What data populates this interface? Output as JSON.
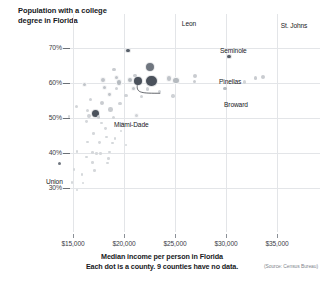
{
  "chart_data": {
    "type": "scatter",
    "title": "Population with a college degree in Florida",
    "xlabel": "Median income per person in Florida",
    "sublabel": "Each dot is a county. 9 counties have no data.",
    "source": "(Source: Census Bureau)",
    "xlim": [
      12500,
      36500
    ],
    "ylim": [
      26,
      73
    ],
    "xticks": [
      15000,
      20000,
      25000,
      30000,
      35000
    ],
    "xtick_labels": [
      "$15,000",
      "$20,000",
      "$25,000",
      "$30,000",
      "$35,000"
    ],
    "yticks": [
      30,
      40,
      50,
      60,
      70
    ],
    "ytick_labels": [
      "30%",
      "40%",
      "50%",
      "60%",
      "70%"
    ],
    "grid": true,
    "legend": "none",
    "size_encoding": "county population",
    "points": [
      {
        "label": "Leon",
        "x": 20400,
        "y": 69.3,
        "r": 2.6,
        "shade": "#58606a"
      },
      {
        "label": "St. Johns",
        "x": 30300,
        "y": 67.6,
        "r": 2.6,
        "shade": "#58606a"
      },
      {
        "label": "Seminole",
        "x": 22500,
        "y": 64.5,
        "r": 5.0,
        "shade": "#6f767f"
      },
      {
        "label": "Pinellas",
        "x": 22700,
        "y": 60.6,
        "r": 6.4,
        "shade": "#4b525c"
      },
      {
        "label": "Broward",
        "x": 21400,
        "y": 60.5,
        "r": 4.8,
        "shade": "#4b525c"
      },
      {
        "label": "Miami-Dade",
        "x": 17200,
        "y": 51.3,
        "r": 4.5,
        "shade": "#4b525c"
      },
      {
        "label": "Union",
        "x": 13700,
        "y": 37.0,
        "r": 1.5,
        "shade": "#6f767f"
      },
      {
        "label": "",
        "x": 19000,
        "y": 63.9,
        "r": 1.8,
        "shade": "#c9ccd0"
      },
      {
        "label": "",
        "x": 21100,
        "y": 62.1,
        "r": 1.8,
        "shade": "#c9ccd0"
      },
      {
        "label": "",
        "x": 24400,
        "y": 61.3,
        "r": 3.2,
        "shade": "#c0c4c9"
      },
      {
        "label": "",
        "x": 25100,
        "y": 60.7,
        "r": 3.6,
        "shade": "#b5babf"
      },
      {
        "label": "",
        "x": 27000,
        "y": 62.0,
        "r": 2.0,
        "shade": "#c9ccd0"
      },
      {
        "label": "",
        "x": 26900,
        "y": 60.4,
        "r": 1.7,
        "shade": "#c9ccd0"
      },
      {
        "label": "",
        "x": 29900,
        "y": 58.4,
        "r": 1.9,
        "shade": "#b5babf"
      },
      {
        "label": "",
        "x": 32900,
        "y": 61.5,
        "r": 1.9,
        "shade": "#c9ccd0"
      },
      {
        "label": "",
        "x": 33600,
        "y": 61.8,
        "r": 2.2,
        "shade": "#c9ccd0"
      },
      {
        "label": "",
        "x": 31800,
        "y": 60.3,
        "r": 1.6,
        "shade": "#d2d5d8"
      },
      {
        "label": "",
        "x": 17900,
        "y": 61.0,
        "r": 3.0,
        "shade": "#c0c4c9"
      },
      {
        "label": "",
        "x": 19300,
        "y": 61.6,
        "r": 2.6,
        "shade": "#c0c4c9"
      },
      {
        "label": "",
        "x": 19500,
        "y": 60.2,
        "r": 3.3,
        "shade": "#b5babf"
      },
      {
        "label": "",
        "x": 20600,
        "y": 60.9,
        "r": 3.3,
        "shade": "#b5babf"
      },
      {
        "label": "",
        "x": 16100,
        "y": 59.6,
        "r": 2.6,
        "shade": "#c0c4c9"
      },
      {
        "label": "",
        "x": 18100,
        "y": 58.7,
        "r": 2.5,
        "shade": "#c0c4c9"
      },
      {
        "label": "",
        "x": 19300,
        "y": 58.5,
        "r": 1.6,
        "shade": "#cfd2d6"
      },
      {
        "label": "",
        "x": 20900,
        "y": 58.4,
        "r": 2.6,
        "shade": "#c0c4c9"
      },
      {
        "label": "",
        "x": 22300,
        "y": 58.3,
        "r": 1.7,
        "shade": "#cfd2d6"
      },
      {
        "label": "",
        "x": 23500,
        "y": 57.6,
        "r": 1.6,
        "shade": "#cfd2d6"
      },
      {
        "label": "",
        "x": 18600,
        "y": 56.8,
        "r": 2.4,
        "shade": "#c0c4c9"
      },
      {
        "label": "",
        "x": 20200,
        "y": 56.5,
        "r": 1.7,
        "shade": "#cfd2d6"
      },
      {
        "label": "",
        "x": 21700,
        "y": 56.1,
        "r": 1.7,
        "shade": "#cfd2d6"
      },
      {
        "label": "",
        "x": 24800,
        "y": 56.3,
        "r": 1.7,
        "shade": "#cfd2d6"
      },
      {
        "label": "",
        "x": 16700,
        "y": 55.3,
        "r": 1.7,
        "shade": "#cfd2d6"
      },
      {
        "label": "",
        "x": 17800,
        "y": 54.4,
        "r": 2.0,
        "shade": "#c9ccd0"
      },
      {
        "label": "",
        "x": 19600,
        "y": 54.1,
        "r": 1.6,
        "shade": "#cfd2d6"
      },
      {
        "label": "",
        "x": 15300,
        "y": 53.3,
        "r": 1.5,
        "shade": "#d2d5d8"
      },
      {
        "label": "",
        "x": 16400,
        "y": 52.2,
        "r": 1.5,
        "shade": "#d2d5d8"
      },
      {
        "label": "",
        "x": 18700,
        "y": 52.4,
        "r": 2.3,
        "shade": "#c9ccd0"
      },
      {
        "label": "",
        "x": 14600,
        "y": 50.4,
        "r": 1.4,
        "shade": "#d2d5d8"
      },
      {
        "label": "",
        "x": 16600,
        "y": 50.5,
        "r": 1.9,
        "shade": "#cfd2d6"
      },
      {
        "label": "",
        "x": 17500,
        "y": 50.3,
        "r": 1.8,
        "shade": "#cfd2d6"
      },
      {
        "label": "",
        "x": 19000,
        "y": 50.1,
        "r": 1.5,
        "shade": "#d2d5d8"
      },
      {
        "label": "",
        "x": 16300,
        "y": 49.1,
        "r": 1.4,
        "shade": "#d5d8db"
      },
      {
        "label": "",
        "x": 17800,
        "y": 48.6,
        "r": 1.4,
        "shade": "#d5d8db"
      },
      {
        "label": "",
        "x": 19900,
        "y": 48.5,
        "r": 1.5,
        "shade": "#d5d8db"
      },
      {
        "label": "",
        "x": 21200,
        "y": 50.8,
        "r": 2.6,
        "shade": "#cfd2d6"
      },
      {
        "label": "",
        "x": 18200,
        "y": 46.9,
        "r": 1.4,
        "shade": "#d5d8db"
      },
      {
        "label": "",
        "x": 19700,
        "y": 46.3,
        "r": 1.3,
        "shade": "#d5d8db"
      },
      {
        "label": "",
        "x": 17000,
        "y": 45.5,
        "r": 1.3,
        "shade": "#d5d8db"
      },
      {
        "label": "",
        "x": 18300,
        "y": 44.6,
        "r": 1.4,
        "shade": "#d5d8db"
      },
      {
        "label": "",
        "x": 19100,
        "y": 44.2,
        "r": 1.3,
        "shade": "#d5d8db"
      },
      {
        "label": "",
        "x": 16400,
        "y": 43.2,
        "r": 1.3,
        "shade": "#d5d8db"
      },
      {
        "label": "",
        "x": 17600,
        "y": 43.0,
        "r": 1.4,
        "shade": "#d5d8db"
      },
      {
        "label": "",
        "x": 18900,
        "y": 42.8,
        "r": 1.3,
        "shade": "#d5d8db"
      },
      {
        "label": "",
        "x": 20200,
        "y": 42.3,
        "r": 1.3,
        "shade": "#d5d8db"
      },
      {
        "label": "",
        "x": 15400,
        "y": 40.4,
        "r": 1.4,
        "shade": "#d5d8db"
      },
      {
        "label": "",
        "x": 16900,
        "y": 40.1,
        "r": 1.3,
        "shade": "#d5d8db"
      },
      {
        "label": "",
        "x": 17300,
        "y": 39.9,
        "r": 1.3,
        "shade": "#d5d8db"
      },
      {
        "label": "",
        "x": 17700,
        "y": 39.9,
        "r": 1.3,
        "shade": "#d5d8db"
      },
      {
        "label": "",
        "x": 18600,
        "y": 40.3,
        "r": 1.3,
        "shade": "#d5d8db"
      },
      {
        "label": "",
        "x": 16300,
        "y": 38.8,
        "r": 1.3,
        "shade": "#d5d8db"
      },
      {
        "label": "",
        "x": 18500,
        "y": 38.4,
        "r": 1.3,
        "shade": "#d5d8db"
      },
      {
        "label": "",
        "x": 16900,
        "y": 37.3,
        "r": 1.3,
        "shade": "#d5d8db"
      },
      {
        "label": "",
        "x": 18400,
        "y": 37.2,
        "r": 1.3,
        "shade": "#d5d8db"
      },
      {
        "label": "",
        "x": 15100,
        "y": 35.3,
        "r": 1.3,
        "shade": "#d5d8db"
      },
      {
        "label": "",
        "x": 17100,
        "y": 35.0,
        "r": 1.3,
        "shade": "#d5d8db"
      },
      {
        "label": "",
        "x": 15900,
        "y": 33.8,
        "r": 1.3,
        "shade": "#d5d8db"
      },
      {
        "label": "",
        "x": 14900,
        "y": 31.5,
        "r": 1.3,
        "shade": "#d5d8db"
      },
      {
        "label": "",
        "x": 16000,
        "y": 31.4,
        "r": 1.3,
        "shade": "#d5d8db"
      },
      {
        "label": "",
        "x": 15400,
        "y": 29.4,
        "r": 1.3,
        "shade": "#d5d8db"
      }
    ],
    "annotations": [
      {
        "name": "Leon",
        "text": "Leon",
        "tx": 189,
        "ty": 20,
        "align": "center"
      },
      {
        "name": "St. Johns",
        "text": "St. Johns",
        "tx": 294,
        "ty": 22,
        "align": "center"
      },
      {
        "name": "Seminole",
        "text": "Seminole",
        "tx": 220,
        "ty": 47,
        "align": "left"
      },
      {
        "name": "Pinellas",
        "text": "Pinellas",
        "tx": 219,
        "ty": 78,
        "align": "left"
      },
      {
        "name": "Broward",
        "text": "Broward",
        "tx": 224,
        "ty": 101,
        "align": "left"
      },
      {
        "name": "Miami-Dade",
        "text": "Miami-Dade",
        "tx": 114,
        "ty": 121,
        "align": "left"
      },
      {
        "name": "Union",
        "text": "Union",
        "tx": 46,
        "ty": 178,
        "align": "left"
      }
    ]
  }
}
